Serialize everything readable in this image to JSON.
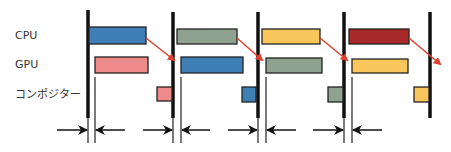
{
  "rows": {
    "cpu": "CPU",
    "gpu": "GPU",
    "compositor": "コンポジター"
  },
  "colors": {
    "blue": "#3f7fb5",
    "pink": "#ef8a8a",
    "green": "#8fa28f",
    "yellow": "#f8c65a",
    "red": "#a8292a",
    "arrow": "#e0402e",
    "line": "#111111"
  },
  "frames": [
    {
      "cpu_color": "blue",
      "gpu_color": "pink",
      "comp_color": "pink"
    },
    {
      "cpu_color": "green",
      "gpu_color": "blue",
      "comp_color": "blue"
    },
    {
      "cpu_color": "yellow",
      "gpu_color": "green",
      "comp_color": "green"
    },
    {
      "cpu_color": "red",
      "gpu_color": "yellow",
      "comp_color": "yellow"
    }
  ]
}
